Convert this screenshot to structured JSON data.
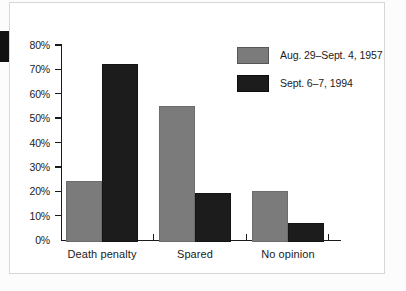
{
  "panel": {
    "background_color": "#ffffff",
    "border_color": "#d7d7d7"
  },
  "margin_mark": {
    "color": "#111111"
  },
  "chart_data": {
    "type": "bar",
    "title": "",
    "subtitle": "",
    "xlabel": "",
    "ylabel": "",
    "categories": [
      "Death penalty",
      "Spared",
      "No opinion"
    ],
    "series": [
      {
        "name": "Aug. 29–Sept. 4, 1957",
        "color": "#7b7b7b",
        "values": [
          25,
          56,
          21
        ]
      },
      {
        "name": "Sept. 6–7, 1994",
        "color": "#1c1c1c",
        "values": [
          73,
          20,
          8
        ]
      }
    ],
    "ylim": [
      0,
      80
    ],
    "ytick_step": 10,
    "ytick_labels": [
      "80%",
      "70%",
      "60%",
      "50%",
      "40%",
      "30%",
      "20%",
      "10%",
      "0%"
    ],
    "ytick_values": [
      80,
      70,
      60,
      50,
      40,
      30,
      20,
      10,
      0
    ],
    "grid": false,
    "legend_position": "top-right",
    "value_suffix": "%"
  }
}
